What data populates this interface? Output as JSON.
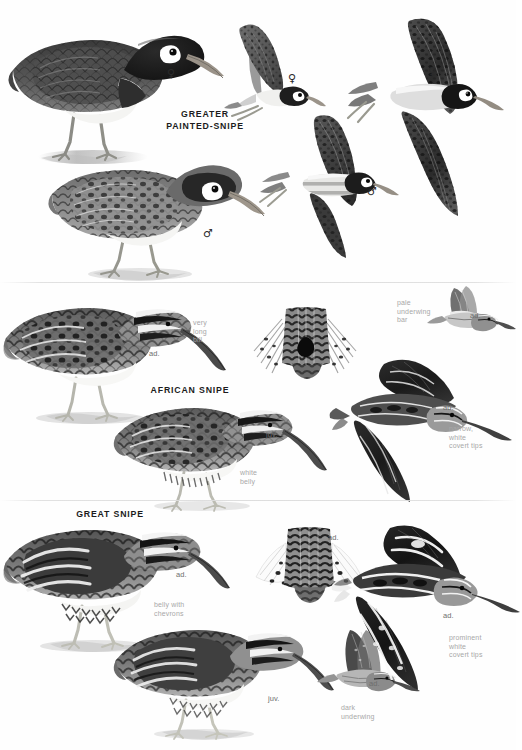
{
  "page": {
    "background_color": "#ffffff",
    "ink_color": "#1c1c1c",
    "note_color": "#a8a8a8",
    "age_label_color": "#6e6e6e"
  },
  "sections": [
    {
      "id": "greater-painted-snipe",
      "species_name": "GREATER\nPAINTED-SNIPE",
      "figures": [
        {
          "name": "standing-female",
          "sex": "♀",
          "pose": "standing"
        },
        {
          "name": "standing-male",
          "sex": "♂",
          "pose": "standing"
        },
        {
          "name": "flying-female-upper",
          "sex": "♀",
          "pose": "flying-away"
        },
        {
          "name": "flying-male",
          "sex": "♂",
          "pose": "flying"
        },
        {
          "name": "flying-female-large",
          "sex": "♀",
          "pose": "flying"
        }
      ],
      "notes": []
    },
    {
      "id": "african-snipe",
      "species_name": "AFRICAN SNIPE",
      "figures": [
        {
          "name": "standing-adult",
          "age": "ad.",
          "pose": "standing"
        },
        {
          "name": "standing-juvenile",
          "age": "juv.",
          "pose": "standing"
        },
        {
          "name": "tail-fan",
          "age": "",
          "pose": "tail-spread"
        },
        {
          "name": "flying-adult-underside",
          "age": "ad.",
          "pose": "flying-underside"
        },
        {
          "name": "flying-adult-upperside",
          "age": "ad.",
          "pose": "flying-upperside"
        }
      ],
      "notes": [
        {
          "name": "very-long-bill-note",
          "text": "very\nlong\nbill"
        },
        {
          "name": "white-belly-note",
          "text": "white\nbelly"
        },
        {
          "name": "pale-underwing-bar-note",
          "text": "pale\nunderwing\nbar"
        },
        {
          "name": "narrow-white-covert-tips-note",
          "text": "narrow,\nwhite\ncovert tips"
        }
      ]
    },
    {
      "id": "great-snipe",
      "species_name": "GREAT SNIPE",
      "figures": [
        {
          "name": "standing-adult",
          "age": "ad.",
          "pose": "standing"
        },
        {
          "name": "standing-juvenile",
          "age": "juv.",
          "pose": "standing"
        },
        {
          "name": "tail-fan",
          "age": "ad.",
          "pose": "tail-spread"
        },
        {
          "name": "flying-adult-underside",
          "age": "ad.",
          "pose": "flying-underside"
        },
        {
          "name": "flying-adult-upperside",
          "age": "ad.",
          "pose": "flying-upperside"
        }
      ],
      "notes": [
        {
          "name": "belly-with-chevrons-note",
          "text": "belly with\nchevrons"
        },
        {
          "name": "dark-underwing-note",
          "text": "dark\nunderwing"
        },
        {
          "name": "prominent-white-covert-tips-note",
          "text": "prominent\nwhite\ncovert tips"
        }
      ]
    }
  ]
}
